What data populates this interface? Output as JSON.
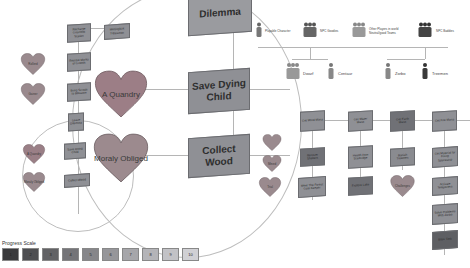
{
  "magnified": {
    "dilemma": "Dilemma",
    "save_child": "Save Dying Child",
    "collect_wood": "Collect Wood",
    "heart_quandry": "A Quandry",
    "heart_obliged": "Moraly Obliged"
  },
  "small_circle": {
    "heart_quandry": "A Quandry",
    "heart_obliged": "Moraly Obliged",
    "save_child": "Save Dying Child",
    "collect_wood": "Collect Wood",
    "partial": "Leave Dilemma"
  },
  "left_column": {
    "top_box": "Recharge Gnarlfoot Station",
    "side_box": "Meltingkirk Tribesman",
    "box2": "Restore Marks of Growth",
    "box3": "Bring Scraps to Blossom",
    "heart1": "Rollerd",
    "heart2": "Gainer"
  },
  "legend": {
    "playable": "Playable Character",
    "npc_goodies": "NPC Goodies",
    "other_players": "Other Players in world Neutral/good Teams",
    "npc_baddies": "NPC Baddies",
    "dwarf": "Dwarf",
    "centaur": "Centaur",
    "zorbo": "Zorbo",
    "treemen": "Treemen"
  },
  "quest_grid": {
    "row1": [
      "Get Wind Mana",
      "Get Water Mana",
      "Get Earth Mana",
      "Get Fire Mana"
    ],
    "row2": [
      "Recover Shelters",
      "Health from Starbridge",
      "Banish Treemen",
      "Get Material for Fixing Spacestrip"
    ],
    "row3": [
      "Meet The Forest Gate Keeper",
      "Explore Lake",
      "Challenges",
      "Activate Teleporters"
    ],
    "col4_extra": [
      "Solve Problems With Zorbo",
      "Boss Task"
    ],
    "side_hearts": [
      "",
      "Mined",
      "Trial"
    ]
  },
  "progress": {
    "title": "Progress Scale",
    "levels": [
      "1",
      "2",
      "3",
      "4",
      "5",
      "6",
      "7",
      "8",
      "9",
      "10"
    ],
    "colors": [
      "#3a3a3c",
      "#4e4e51",
      "#626265",
      "#747478",
      "#86868a",
      "#96969a",
      "#a6a6aa",
      "#b4b4b8",
      "#c2c2c6",
      "#d0d0d4"
    ]
  }
}
